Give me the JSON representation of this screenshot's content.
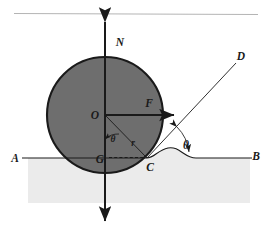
{
  "figure": {
    "type": "physics-free-body-diagram",
    "canvas": {
      "width": 271,
      "height": 237
    },
    "colors": {
      "background": "#ffffff",
      "circle_fill": "#6e6e6e",
      "circle_stroke": "#1a1a1a",
      "ground_fill": "#ebebeb",
      "line": "#1a1a1a",
      "top_rule": "#b0b0b0"
    },
    "labels": [
      {
        "id": "N",
        "text": "N",
        "x": 120,
        "y": 42,
        "size": "lg",
        "meaning": "normal-force-label"
      },
      {
        "id": "D",
        "text": "D",
        "x": 240,
        "y": 56,
        "size": "lg",
        "meaning": "ray-endpoint-label"
      },
      {
        "id": "F",
        "text": "F",
        "x": 148,
        "y": 104,
        "size": "lg",
        "meaning": "applied-force-label"
      },
      {
        "id": "O",
        "text": "O",
        "x": 93,
        "y": 119,
        "size": "lg",
        "meaning": "center-label"
      },
      {
        "id": "theta-inner",
        "text": "θ",
        "x": 111,
        "y": 139,
        "size": "sm",
        "meaning": "inner-angle-label"
      },
      {
        "id": "r",
        "text": "r",
        "x": 130,
        "y": 143,
        "size": "sm",
        "meaning": "radius-label"
      },
      {
        "id": "A",
        "text": "A",
        "x": 14,
        "y": 162,
        "size": "lg",
        "meaning": "ground-left-label"
      },
      {
        "id": "G",
        "text": "G",
        "x": 97,
        "y": 163,
        "size": "lg",
        "meaning": "ground-projection-label"
      },
      {
        "id": "C",
        "text": "C",
        "x": 148,
        "y": 168,
        "size": "lg",
        "meaning": "contact-point-label"
      },
      {
        "id": "theta-outer",
        "text": "θ",
        "x": 186,
        "y": 146,
        "size": "lg",
        "meaning": "outer-angle-label"
      },
      {
        "id": "B",
        "text": "B",
        "x": 254,
        "y": 160,
        "size": "lg",
        "meaning": "ground-right-label"
      }
    ],
    "geometry": {
      "circle": {
        "cx": 105,
        "cy": 115,
        "r": 58
      },
      "ground_line": {
        "x1": 22,
        "y1": 158,
        "x2": 252,
        "y2": 158
      },
      "ground_block": {
        "x": 28,
        "y": 158,
        "width": 222,
        "height": 45
      },
      "normal_axis": {
        "x": 105,
        "y_top": 18,
        "y_bottom": 225
      },
      "force_arrow": {
        "x1": 105,
        "y1": 115,
        "x2": 178,
        "y2": 115
      },
      "ray_cd": {
        "x1": 147,
        "y1": 158,
        "x2": 236,
        "y2": 63
      },
      "radius_oc": {
        "x1": 105,
        "y1": 115,
        "x2": 147,
        "y2": 158
      },
      "dashed_gc": {
        "x1": 108,
        "y1": 158,
        "x2": 146,
        "y2": 158
      },
      "top_rule": {
        "x1": 14,
        "y1": 13,
        "x2": 258,
        "y2": 14
      },
      "angle_arc_inner": {
        "cx": 105,
        "cy": 115,
        "r": 22,
        "start_deg": 0,
        "end_deg": 45
      },
      "angle_arc_outer": {
        "cx": 147,
        "cy": 158,
        "r": 45,
        "start_deg": 0,
        "end_deg": 47
      },
      "bump_curve": "contact deformation bump right of C"
    }
  }
}
